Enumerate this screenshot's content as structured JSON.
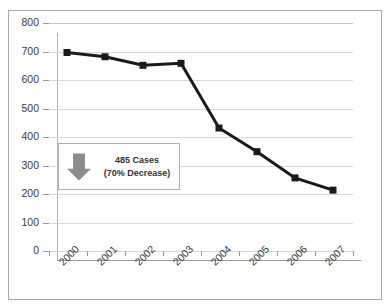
{
  "chart_data": {
    "type": "line",
    "title": "",
    "subtitle": "",
    "xlabel": "",
    "ylabel": "",
    "categories": [
      "2000",
      "2001",
      "2002",
      "2003",
      "2004",
      "2005",
      "2006",
      "2007"
    ],
    "values": [
      693,
      678,
      648,
      655,
      428,
      345,
      253,
      210
    ],
    "series": [
      {
        "name": "Cases",
        "values": [
          693,
          678,
          648,
          655,
          428,
          345,
          253,
          210
        ]
      }
    ],
    "ylim": [
      0,
      800
    ],
    "ytick_values": [
      0,
      100,
      200,
      300,
      400,
      500,
      600,
      700,
      800
    ],
    "ytick_labels": [
      "0",
      "100",
      "200",
      "300",
      "400",
      "500",
      "600",
      "700",
      "800"
    ],
    "grid": "horizontal",
    "legend": "none",
    "marker": "square",
    "line_color": "#1a1a1a",
    "marker_color": "#1a1a1a",
    "grid_color": "#d9d9d9",
    "annotations": [
      {
        "icon": "down-arrow-icon",
        "arrow_color": "#808080",
        "line1": "485 Cases",
        "line2": "(70% Decrease)"
      }
    ]
  },
  "frame": {
    "border_color": "#a8a8a8"
  }
}
